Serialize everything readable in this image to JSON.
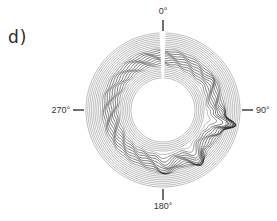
{
  "figure": {
    "panel_label": "d)"
  },
  "chart_data": {
    "type": "polar-waterfall",
    "title": "",
    "angular_ticks": [
      {
        "angle": 0,
        "label": "0°"
      },
      {
        "angle": 90,
        "label": "90°"
      },
      {
        "angle": 180,
        "label": "180°"
      },
      {
        "angle": 270,
        "label": "270°"
      }
    ],
    "angular_direction": "clockwise",
    "zero_location": "top",
    "center_px": [
      163,
      110
    ],
    "inner_radius_px": 32,
    "outer_radius_px": 77,
    "trace_count": 26,
    "features": [
      {
        "angle": 102,
        "description": "largest outward spike, double-peaked",
        "relative_height": 1.0,
        "width_deg": 14
      },
      {
        "angle": 145,
        "description": "secondary spike",
        "relative_height": 0.55,
        "width_deg": 10
      },
      {
        "angle": 178,
        "description": "small double bump",
        "relative_height": 0.35,
        "width_deg": 12
      },
      {
        "angle": 60,
        "description": "faint bump",
        "relative_height": 0.15,
        "width_deg": 10
      }
    ],
    "feature_radial_band": [
      0.2,
      0.7
    ],
    "grid": false,
    "legend": null,
    "line_color": "#222222"
  }
}
